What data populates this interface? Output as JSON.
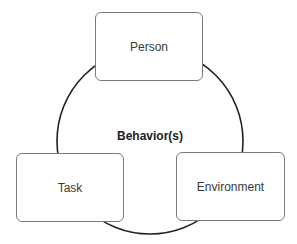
{
  "diagram": {
    "center_label": "Behavior(s)",
    "nodes": [
      {
        "id": "person",
        "label": "Person"
      },
      {
        "id": "task",
        "label": "Task"
      },
      {
        "id": "environment",
        "label": "Environment"
      }
    ],
    "colors": {
      "ring": "#222222",
      "box_border": "#7a7a7a",
      "text": "#3a3a3a"
    }
  }
}
